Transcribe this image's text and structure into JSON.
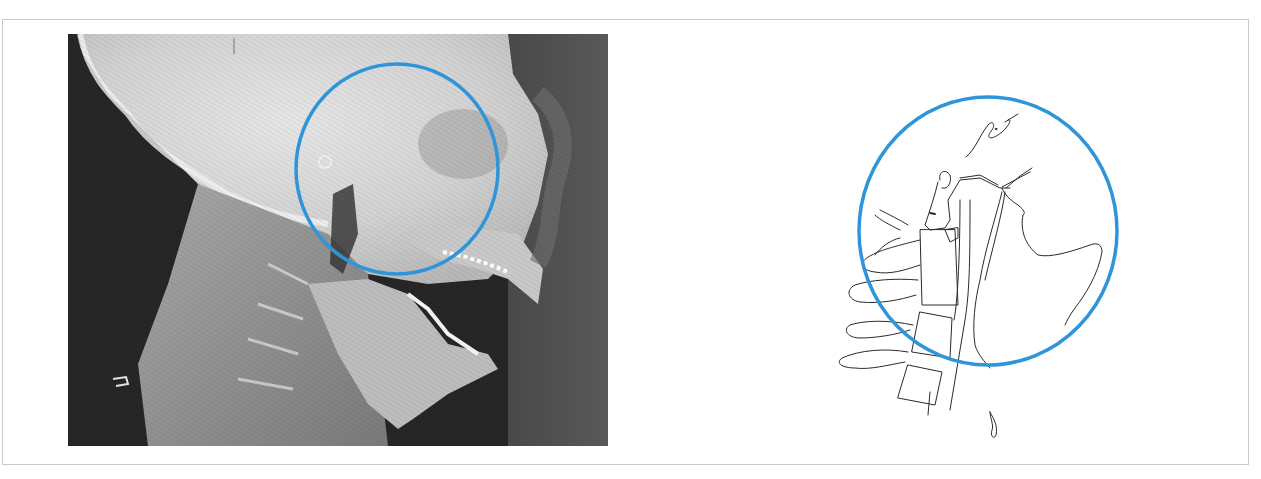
{
  "figure": {
    "panels": [
      {
        "id": "left",
        "kind": "lateral-radiograph",
        "description": "Lateral cephalometric X-ray of head and neck, mouth open, with highlighted region",
        "highlight": {
          "shape": "ellipse",
          "color": "#2e95d8"
        }
      },
      {
        "id": "right",
        "kind": "line-tracing",
        "description": "Line drawing tracing of the radiograph showing cervical vertebrae, airway and mandible",
        "highlight": {
          "shape": "ellipse",
          "color": "#2e95d8"
        }
      }
    ],
    "colors": {
      "frame_border": "#c9c9c9",
      "highlight_circle": "#2e95d8",
      "tracing_line": "#2a2a2a",
      "background": "#ffffff"
    }
  }
}
